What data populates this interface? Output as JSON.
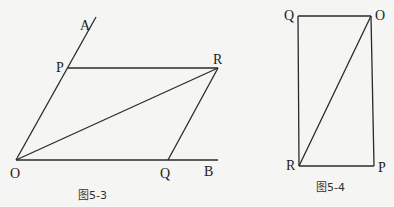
{
  "figures": [
    {
      "caption": "图5-3",
      "points": {
        "A": "A",
        "P": "P",
        "R": "R",
        "O": "O",
        "Q": "Q",
        "B": "B"
      },
      "segments": [
        "OA",
        "PR",
        "OB",
        "OR",
        "QR"
      ]
    },
    {
      "caption": "图5-4",
      "points": {
        "Q": "Q",
        "O": "O",
        "R": "R",
        "P": "P"
      },
      "segments": [
        "QO",
        "QR",
        "OP",
        "RP",
        "RO"
      ]
    }
  ]
}
